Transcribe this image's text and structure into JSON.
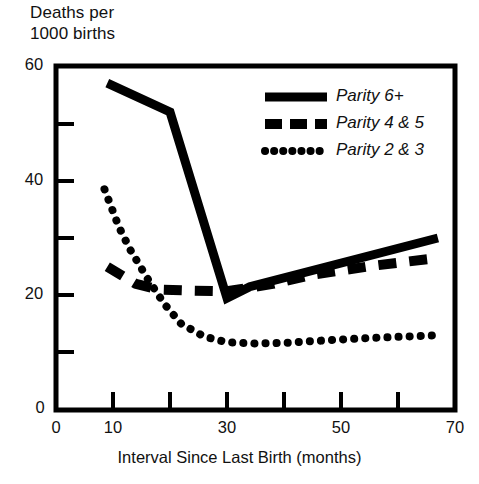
{
  "chart_data": {
    "type": "line",
    "title": "",
    "ylabel": "Deaths per\n1000 births",
    "ylabel_lines": [
      "Deaths per",
      "1000 births"
    ],
    "xlabel": "Interval Since Last Birth (months)",
    "xlim": [
      0,
      70
    ],
    "ylim": [
      0,
      60
    ],
    "xticks": [
      0,
      10,
      20,
      30,
      40,
      50,
      60,
      70
    ],
    "xtick_labels": [
      "0",
      "10",
      "",
      "30",
      "",
      "50",
      "",
      "70"
    ],
    "yticks": [
      0,
      10,
      20,
      30,
      40,
      50,
      60
    ],
    "ytick_labels": [
      "0",
      "",
      "20",
      "",
      "40",
      "",
      "60"
    ],
    "grid": false,
    "legend_position": "upper right",
    "series": [
      {
        "name": "Parity 6+",
        "style": "solid",
        "color": "#000000",
        "x": [
          9,
          20,
          30,
          34,
          67
        ],
        "y": [
          57,
          52,
          19.5,
          21.5,
          30
        ]
      },
      {
        "name": "Parity 4 & 5",
        "style": "dashed",
        "color": "#000000",
        "x": [
          9,
          14,
          18,
          24,
          30,
          38,
          45,
          56,
          66
        ],
        "y": [
          25,
          22,
          21,
          20.8,
          20.7,
          22,
          23.6,
          25.2,
          26.4
        ]
      },
      {
        "name": "Parity 2 & 3",
        "style": "dotted",
        "color": "#000000",
        "x": [
          8.5,
          11,
          13,
          16,
          19,
          22,
          26,
          30,
          35,
          40,
          48,
          56,
          66
        ],
        "y": [
          38.5,
          32,
          28,
          23,
          18.5,
          15,
          12.8,
          11.8,
          11.6,
          11.7,
          12.2,
          12.6,
          13
        ]
      }
    ]
  },
  "legend": {
    "items": [
      {
        "label": "Parity 6+",
        "style": "solid"
      },
      {
        "label": "Parity 4 & 5",
        "style": "dashed"
      },
      {
        "label": "Parity 2 & 3",
        "style": "dotted"
      }
    ]
  },
  "axes": {
    "y_title_line1": "Deaths per",
    "y_title_line2": "1000 births",
    "x_title": "Interval Since Last Birth (months)",
    "y_tick_60": "60",
    "y_tick_40": "40",
    "y_tick_20": "20",
    "y_tick_0": "0",
    "x_tick_0": "0",
    "x_tick_10": "10",
    "x_tick_30": "30",
    "x_tick_50": "50",
    "x_tick_70": "70"
  },
  "colors": {
    "ink": "#000000",
    "background": "#ffffff"
  }
}
